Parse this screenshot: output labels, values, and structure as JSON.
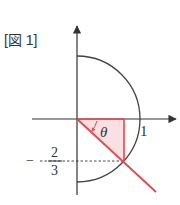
{
  "figure": {
    "title": "[図 1]",
    "labels": {
      "one": "1",
      "theta": "θ",
      "neg_sign": "−",
      "frac_num": "2",
      "frac_den": "3"
    },
    "colors": {
      "axis": "#333333",
      "circle": "#444444",
      "accent": "#e8474a",
      "fill": "#fbe0e3",
      "text": "#333333"
    },
    "geometry": {
      "origin": [
        77,
        119
      ],
      "radius": 63,
      "point_on_circle": {
        "x": "√5/3",
        "y": "-2/3"
      }
    }
  }
}
